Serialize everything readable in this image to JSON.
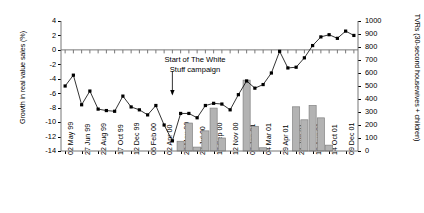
{
  "chart_data": {
    "type": "bar",
    "title": "",
    "xlabel": "",
    "ylabel": "Growth in real value sales (%)",
    "ylabel_right": "TVRs (30-second housewives + children)",
    "ylim": [
      -14,
      4
    ],
    "ylim_right": [
      0,
      1000
    ],
    "yticks": [
      4,
      2,
      0,
      -2,
      -4,
      -6,
      -8,
      -10,
      -12,
      -14
    ],
    "yticks_right": [
      1000,
      900,
      800,
      700,
      600,
      500,
      400,
      300,
      200,
      100,
      0
    ],
    "grid": false,
    "legend": "none",
    "categories": [
      "02 May 99",
      "",
      "27 Jun 99",
      "",
      "22 Aug 99",
      "",
      "17 Oct 99",
      "",
      "12 Dec 99",
      "",
      "06 Feb 00",
      "",
      "02 Apr 00",
      "",
      "28 May 00",
      "",
      "23 Jul 00",
      "",
      "17 Sep 00",
      "",
      "12 Nov 00",
      "",
      "07 Jan 01",
      "",
      "04 Mar 01",
      "",
      "29 Apr 01",
      "",
      "24 Jun 01",
      "",
      "19 Aug 01",
      "",
      "14 Oct 01",
      "",
      "09 Dec 01"
    ],
    "xtick_labels": [
      "02 May 99",
      "27 Jun 99",
      "22 Aug 99",
      "17 Oct 99",
      "12 Dec 99",
      "06 Feb 00",
      "02 Apr 00",
      "28 May 00",
      "23 Jul 00",
      "17 Sep 00",
      "12 Nov 00",
      "07 Jan 01",
      "04 Mar 01",
      "29 Apr 01",
      "24 Jun 01",
      "19 Aug 01",
      "14 Oct 01",
      "09 Dec 01"
    ],
    "series": [
      {
        "name": "Growth in real value sales (%)",
        "type": "line",
        "axis": "left",
        "marker": "square",
        "color": "#000000",
        "x": [
          0,
          1,
          2,
          3,
          4,
          5,
          6,
          7,
          8,
          9,
          10,
          11,
          12,
          13,
          14,
          15,
          16,
          17,
          18,
          19,
          20,
          21,
          22,
          23,
          24,
          25,
          26,
          27,
          28,
          29,
          30,
          31,
          32,
          33,
          34,
          35
        ],
        "values": [
          -5.0,
          -3.5,
          -7.6,
          -5.7,
          -8.2,
          -8.4,
          -8.5,
          -6.4,
          -7.9,
          -8.3,
          -9.0,
          -7.7,
          -10.4,
          -12.6,
          -8.8,
          -8.8,
          -9.4,
          -7.7,
          -7.4,
          -7.5,
          -8.3,
          -6.2,
          -4.3,
          -5.3,
          -4.8,
          -3.2,
          -0.2,
          -2.5,
          -2.4,
          -1.1,
          0.6,
          1.8,
          2.1,
          1.6,
          2.6,
          2.0
        ]
      },
      {
        "name": "TVRs (30-second housewives + children)",
        "type": "bar",
        "axis": "right",
        "color": "#b3b3b3",
        "edge_color": "#808080",
        "x": [
          14,
          15,
          16,
          17,
          18,
          19,
          22,
          23,
          24,
          28,
          29,
          30,
          31,
          32
        ],
        "values": [
          75,
          215,
          30,
          155,
          330,
          100,
          545,
          190,
          25,
          340,
          240,
          350,
          255,
          45
        ]
      }
    ],
    "annotations": [
      {
        "text_line1": "Start of The White",
        "text_line2": "Stuff campaign",
        "arrow": "down",
        "points_to_x": 13
      }
    ]
  },
  "axes": {
    "left_title": "Growth in real value sales (%)",
    "right_title": "TVRs (30-second housewives + children)"
  }
}
